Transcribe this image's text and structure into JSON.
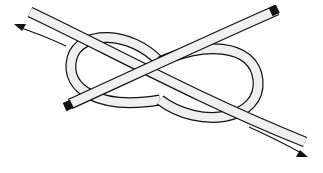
{
  "diagram": {
    "colors": {
      "background": "#ffffff",
      "rope_fill": "#f0f0f0",
      "outline": "#111111"
    },
    "arrows": [
      {
        "name": "arrow-upper-left",
        "direction": "up-left"
      },
      {
        "name": "arrow-lower-right",
        "direction": "down-right"
      }
    ]
  }
}
